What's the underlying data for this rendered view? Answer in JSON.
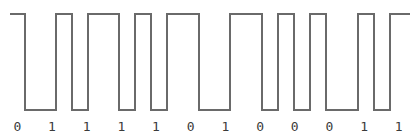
{
  "figure": {
    "type": "digital-waveform",
    "width": 416,
    "height": 140,
    "background_color": "#ffffff",
    "line_color": "#6a6a6a",
    "label_color": "#3b3b3b",
    "line_width": 2
  },
  "waveform": {
    "high_y": 14,
    "low_y": 110,
    "start_x": 10,
    "end_x": 410,
    "bit_period": 32.5,
    "encoding": "manchester",
    "points": [
      [
        10,
        14
      ],
      [
        25,
        14
      ],
      [
        25,
        110
      ],
      [
        56,
        110
      ],
      [
        56,
        14
      ],
      [
        72,
        14
      ],
      [
        72,
        110
      ],
      [
        88,
        110
      ],
      [
        88,
        14
      ],
      [
        119,
        14
      ],
      [
        119,
        110
      ],
      [
        135,
        110
      ],
      [
        135,
        14
      ],
      [
        151,
        14
      ],
      [
        151,
        110
      ],
      [
        167,
        110
      ],
      [
        167,
        14
      ],
      [
        199,
        14
      ],
      [
        199,
        110
      ],
      [
        230,
        110
      ],
      [
        230,
        14
      ],
      [
        262,
        14
      ],
      [
        262,
        110
      ],
      [
        278,
        110
      ],
      [
        278,
        14
      ],
      [
        294,
        14
      ],
      [
        294,
        110
      ],
      [
        310,
        110
      ],
      [
        310,
        14
      ],
      [
        326,
        14
      ],
      [
        326,
        110
      ],
      [
        358,
        110
      ],
      [
        358,
        14
      ],
      [
        374,
        14
      ],
      [
        374,
        110
      ],
      [
        390,
        110
      ],
      [
        390,
        14
      ],
      [
        410,
        14
      ]
    ]
  },
  "bit_labels": {
    "count": 12,
    "values": [
      "0",
      "1",
      "1",
      "1",
      "1",
      "0",
      "1",
      "0",
      "0",
      "0",
      "1",
      "1"
    ],
    "sequence_string": "011110100011"
  },
  "chart_data": {
    "type": "line",
    "title": "",
    "xlabel": "",
    "ylabel": "",
    "categories": [
      "0",
      "1",
      "1",
      "1",
      "1",
      "0",
      "1",
      "0",
      "0",
      "0",
      "1",
      "1"
    ],
    "values": [
      0,
      1,
      1,
      1,
      1,
      0,
      1,
      0,
      0,
      0,
      1,
      1
    ],
    "ylim": [
      0,
      1
    ],
    "grid": false,
    "legend": "none",
    "annotations": [
      "Square-wave digital signal plotted above a row of 12 bit labels",
      "Bit sequence reads 0 1 1 1 1 0 1 0 0 0 1 1 from left to right"
    ]
  }
}
